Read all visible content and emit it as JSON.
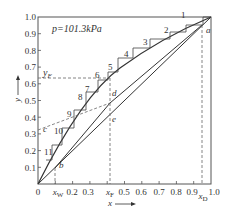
{
  "diagram": {
    "type": "McCabe-Thiele x-y diagram",
    "pressure_label": "p=101.3kPa",
    "x_axis": {
      "label": "x",
      "ticks": [
        "0",
        "xW",
        "0.2",
        "0.3",
        "xF",
        "0.5",
        "0.6",
        "0.7",
        "0.8",
        "0.9",
        "1.0"
      ],
      "special": {
        "xW": "x_W",
        "xF": "x_F",
        "xD": "x_D"
      }
    },
    "y_axis": {
      "label": "y",
      "ticks": [
        "0.1",
        "0.2",
        "0.3",
        "0.4",
        "0.5",
        "0.6",
        "0.7",
        "0.8",
        "0.9",
        "1.0"
      ],
      "special": {
        "yF": "y_F"
      }
    },
    "points": [
      "a",
      "b",
      "c",
      "d",
      "e"
    ],
    "stages": [
      "1",
      "2",
      "3",
      "4",
      "5",
      "6",
      "7",
      "8",
      "9",
      "10",
      "11"
    ],
    "values": {
      "xW": 0.1,
      "xF": 0.44,
      "xD": 0.95,
      "yF": 0.63,
      "c_intercept": 0.32
    }
  },
  "labels": {
    "p": "p=101.3kPa",
    "yF": "y",
    "yF_sub": "F",
    "x": "x",
    "y": "y",
    "xW": "x",
    "xW_sub": "W",
    "xF": "x",
    "xF_sub": "F",
    "xD": "x",
    "xD_sub": "D",
    "a": "a",
    "b": "b",
    "c": "c",
    "d": "d",
    "e": "e",
    "s1": "1",
    "s2": "2",
    "s3": "3",
    "s4": "4",
    "s5": "5",
    "s6": "6",
    "s7": "7",
    "s8": "8",
    "s9": "9",
    "s10": "10",
    "s11": "11",
    "t0": "0",
    "t02": "0.2",
    "t03": "0.3",
    "t05": "0.5",
    "t06": "0.6",
    "t07": "0.7",
    "t08": "0.8",
    "t09": "0.9",
    "t10": "1.0",
    "y01": "0.1",
    "y02": "0.2",
    "y03": "0.3",
    "y04": "0.4",
    "y05": "0.5",
    "y06": "0.6",
    "y07": "0.7",
    "y08": "0.8",
    "y09": "0.9",
    "y10": "1.0"
  }
}
